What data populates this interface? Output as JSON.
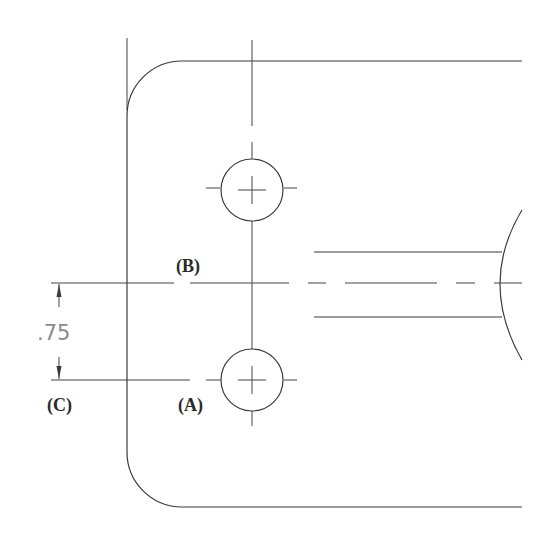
{
  "drawing": {
    "type": "technical-drawing",
    "labels": {
      "B": "(B)",
      "C": "(C)",
      "A": "(A)"
    },
    "dimension": {
      "value": ".75"
    },
    "colors": {
      "line": "#3a3a3a",
      "dimension_text": "#8a8a8a",
      "background": "#ffffff"
    }
  }
}
